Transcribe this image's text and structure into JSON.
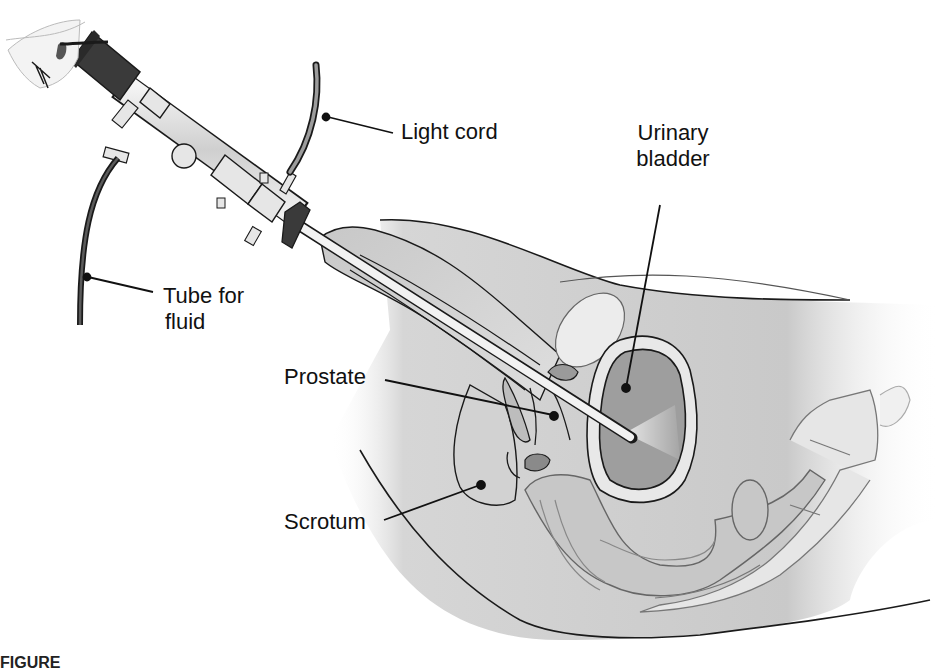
{
  "figure": {
    "type": "medical-illustration",
    "labels": [
      {
        "id": "light-cord",
        "text": "Light cord"
      },
      {
        "id": "urinary-bladder",
        "line1": "Urinary",
        "line2": "bladder"
      },
      {
        "id": "tube-for-fluid",
        "line1": "Tube for",
        "line2": "fluid"
      },
      {
        "id": "prostate",
        "text": "Prostate"
      },
      {
        "id": "scrotum",
        "text": "Scrotum"
      }
    ],
    "caption": "FIGURE",
    "colors": {
      "background": "#ffffff",
      "outline": "#1a1a1a",
      "tissue_light": "#d9d9d9",
      "tissue_mid": "#bdbdbd",
      "tissue_dark": "#9a9a9a",
      "instrument_dark": "#3a3a3a",
      "instrument_light": "#e6e6e6"
    }
  }
}
